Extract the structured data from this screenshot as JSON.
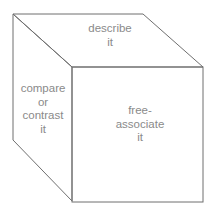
{
  "diagram": {
    "type": "cube",
    "colors": {
      "edge": "#6f6f6f",
      "text": "#8a8a8a",
      "background": "#ffffff"
    },
    "faces": {
      "top": {
        "lines": [
          "describe",
          "it"
        ],
        "text": "describe\nit"
      },
      "left": {
        "lines": [
          "compare",
          "or",
          "contrast",
          "it"
        ],
        "text": "compare\nor\ncontrast\nit"
      },
      "front": {
        "lines": [
          "free-",
          "associate",
          "it"
        ],
        "text": "free-\nassociate\nit"
      }
    }
  }
}
